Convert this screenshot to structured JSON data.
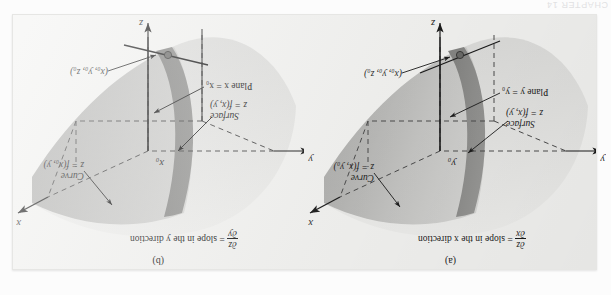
{
  "page": {
    "bleed_header": "CHAPTER 14"
  },
  "figure": {
    "panels": [
      {
        "id": "a",
        "caption": "(a)",
        "equation": {
          "numerator": "∂z",
          "denominator": "∂x",
          "text": "= slope in the x direction"
        },
        "axes": {
          "x": "x",
          "y": "y",
          "z": "z"
        },
        "tick_label": "y₀",
        "annotations": [
          {
            "name": "surface",
            "line1": "Surface",
            "line2": "z = f(x, y)"
          },
          {
            "name": "plane",
            "line1": "Plane y = y₀",
            "line2": ""
          },
          {
            "name": "curve",
            "line1": "Curve",
            "line2": "z = f(x, y₀)"
          },
          {
            "name": "point",
            "line1": "(x₀, y₀, z₀)",
            "line2": ""
          }
        ]
      },
      {
        "id": "b",
        "caption": "(b)",
        "equation": {
          "numerator": "∂z",
          "denominator": "∂y",
          "text": "= slope in the y direction"
        },
        "axes": {
          "x": "x",
          "y": "y",
          "z": "z"
        },
        "tick_label": "x₀",
        "annotations": [
          {
            "name": "surface",
            "line1": "Surface",
            "line2": "z = f(x, y)"
          },
          {
            "name": "plane",
            "line1": "Plane x = x₀",
            "line2": ""
          },
          {
            "name": "curve",
            "line1": "Curve",
            "line2": "z = f(x₀, y)"
          },
          {
            "name": "point",
            "line1": "(x₀, y₀, z₀)",
            "line2": ""
          }
        ]
      }
    ],
    "colors": {
      "panel_bg": "#f2f2f0",
      "surface_light": "#e3e3e1",
      "surface_mid": "#cfcfcd",
      "surface_dark": "#a8a8a6",
      "band_dark": "#8e8e8c",
      "ink": "#1b1b1b",
      "dash": "#4a4a4a"
    }
  }
}
